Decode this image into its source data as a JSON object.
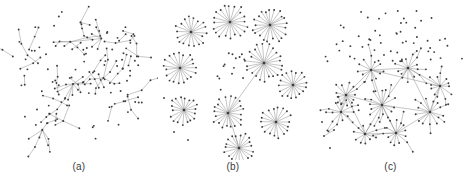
{
  "figure": {
    "width": 473,
    "height": 185,
    "background": "#ffffff",
    "node_color": "#3c3c3c",
    "edge_color": "#8d8d8d",
    "caption_color": "#3a3a3a"
  },
  "panels": [
    {
      "id": "panel-a",
      "caption": "(a)",
      "width": 158,
      "height": 160,
      "type": "sparse-tree-network",
      "description": "Sparse circular layout with a few medium hubs, many short chains, pairs and isolated nodes",
      "seed": 1907,
      "layout": {
        "center_x": 79,
        "center_y": 78,
        "radius": 70
      },
      "counts": {
        "hubs": 7,
        "chains": 26,
        "isolates": 62,
        "total_nodes": 196
      }
    },
    {
      "id": "panel-b",
      "caption": "(b)",
      "width": 150,
      "height": 160,
      "type": "disconnected-star-clusters",
      "description": "Ten to eleven separate star clusters each with a central hub and ~20 radial leaves, a few isolated nodes in the middle and one long edge joining two hubs",
      "seed": 4412,
      "layout": {
        "center_x": 75,
        "center_y": 78,
        "radius": 72
      },
      "stars": [
        {
          "cx": 33,
          "cy": 32,
          "r": 15,
          "spokes": 18
        },
        {
          "cx": 72,
          "cy": 22,
          "r": 17,
          "spokes": 20
        },
        {
          "cx": 112,
          "cy": 25,
          "r": 17,
          "spokes": 21
        },
        {
          "cx": 22,
          "cy": 68,
          "r": 16,
          "spokes": 19
        },
        {
          "cx": 26,
          "cy": 110,
          "r": 14,
          "spokes": 18
        },
        {
          "cx": 106,
          "cy": 63,
          "r": 18,
          "spokes": 22
        },
        {
          "cx": 135,
          "cy": 85,
          "r": 14,
          "spokes": 17
        },
        {
          "cx": 70,
          "cy": 113,
          "r": 16,
          "spokes": 20
        },
        {
          "cx": 118,
          "cy": 122,
          "r": 15,
          "spokes": 18
        },
        {
          "cx": 81,
          "cy": 148,
          "r": 15,
          "spokes": 19
        }
      ],
      "bridges": [
        {
          "from": 5,
          "to": 7
        },
        {
          "from": 7,
          "to": 9
        }
      ],
      "isolates": 14,
      "counts": {
        "clusters": 10,
        "total_nodes": 216
      }
    },
    {
      "id": "panel-c",
      "caption": "(c)",
      "width": 165,
      "height": 160,
      "type": "interconnected-hub-mesh",
      "description": "Dense lower core of interlinked hubs forming a mesh with long-range edges, plus an arc of scattered isolated nodes across the upper region",
      "seed": 7731,
      "layout": {
        "center_x": 82,
        "center_y": 80,
        "radius": 76
      },
      "hubs": [
        {
          "cx": 38,
          "cy": 95,
          "r": 14,
          "spokes": 13
        },
        {
          "cx": 33,
          "cy": 112,
          "r": 12,
          "spokes": 11
        },
        {
          "cx": 63,
          "cy": 70,
          "r": 14,
          "spokes": 12
        },
        {
          "cx": 100,
          "cy": 68,
          "r": 14,
          "spokes": 13
        },
        {
          "cx": 132,
          "cy": 86,
          "r": 13,
          "spokes": 12
        },
        {
          "cx": 122,
          "cy": 112,
          "r": 14,
          "spokes": 13
        },
        {
          "cx": 74,
          "cy": 105,
          "r": 15,
          "spokes": 14
        },
        {
          "cx": 88,
          "cy": 133,
          "r": 14,
          "spokes": 13
        },
        {
          "cx": 57,
          "cy": 134,
          "r": 11,
          "spokes": 10
        }
      ],
      "mesh_edges": [
        [
          0,
          2
        ],
        [
          0,
          1
        ],
        [
          0,
          6
        ],
        [
          2,
          3
        ],
        [
          3,
          4
        ],
        [
          4,
          5
        ],
        [
          5,
          6
        ],
        [
          6,
          2
        ],
        [
          6,
          7
        ],
        [
          7,
          8
        ],
        [
          8,
          6
        ],
        [
          3,
          6
        ],
        [
          0,
          8
        ],
        [
          5,
          7
        ],
        [
          2,
          4
        ],
        [
          1,
          8
        ],
        [
          3,
          5
        ]
      ],
      "isolates": 56,
      "counts": {
        "hubs": 9,
        "total_nodes": 182
      }
    }
  ]
}
